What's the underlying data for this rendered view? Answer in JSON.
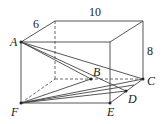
{
  "figure": {
    "type": "rectangular box with segments",
    "dimensions": {
      "depth": "6",
      "width": "10",
      "height": "8"
    },
    "points": {
      "A": "A",
      "B": "B",
      "C": "C",
      "D": "D",
      "E": "E",
      "F": "F"
    },
    "line_color": "#333333"
  }
}
